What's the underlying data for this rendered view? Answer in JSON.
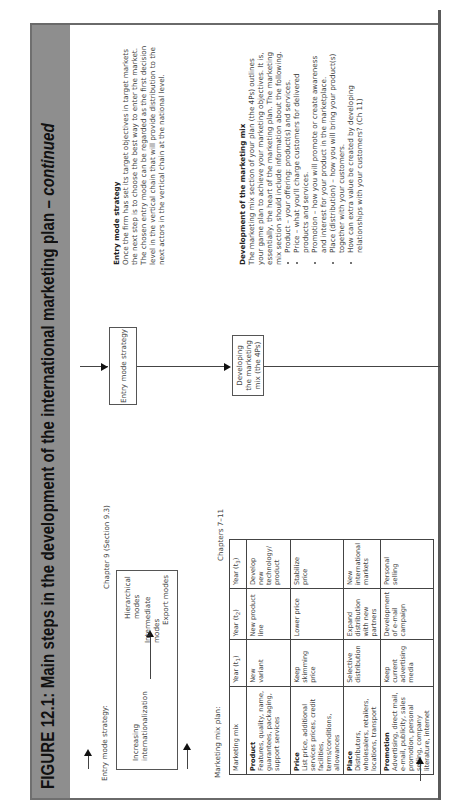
{
  "figure": {
    "title_main": "FIGURE 12.1: Main steps in the development of the international marketing plan – ",
    "title_continued": "continued",
    "header_color": "#8e8e8e"
  },
  "entry_mode_panel": {
    "label": "Entry mode strategy:",
    "axis_label": "Increasing internationalization",
    "modes": [
      "Hierarchical modes",
      "Intermediate modes",
      "Export modes"
    ]
  },
  "marketing_mix_panel": {
    "label": "Marketing mix plan:",
    "table": {
      "headers": [
        "Marketing mix",
        "Year (t1)",
        "Year (t2)",
        "Year (t3)"
      ],
      "rows": [
        {
          "title": "Product",
          "desc": "Features, quality, name, guarantees, packaging, support services",
          "t1": "New variant",
          "t2": "New product line",
          "t3": "Develop new technology/ product"
        },
        {
          "title": "Price",
          "desc": "List price, additional services prices, credit facilities, terms/conditions, allowances",
          "t1": "Keep skimming price",
          "t2": "Lower price",
          "t3": "Stabilize price"
        },
        {
          "title": "Place",
          "desc": "Distributors, wholesalers, retailers, locations, transport",
          "t1": "Selective distribution",
          "t2": "Expand distribution with new partners",
          "t3": "New international markets"
        },
        {
          "title": "Promotion",
          "desc": "Advertising, direct mail, e-mail, publicity, sales promotion, personal selling, company literature, internet",
          "t1": "Keep current advertising media",
          "t2": "Development of e-mail campaign",
          "t3": "Personal selling"
        }
      ]
    }
  },
  "chapter_refs": {
    "entry_mode": "Chapter 9 (Section 9.3)",
    "marketing_mix": "Chapters 7–11"
  },
  "flow_boxes": {
    "entry_mode": "Entry mode strategy",
    "marketing_mix": "Developing the marketing mix (the 4Ps)"
  },
  "descriptions": {
    "entry_mode": {
      "title": "Entry mode strategy",
      "text": "Once the firm has set its target objectives in target markets the next step is to choose the best way to enter the market. The chosen entry mode can be regarded as the first decision level in the vertical chain that will provide distribution to the next actors in the vertical chain at the national level."
    },
    "marketing_mix": {
      "title": "Development of the marketing mix",
      "text": "The marketing mix section of your plan (the 4Ps) outlines your game plan to achieve your marketing objectives. It is, essentially, the heart of the marketing plan. The marketing mix section should include information about the following.",
      "bullets": [
        "Product – your offering: product(s) and services.",
        "Price – what you'll charge customers for delivered products and services.",
        "Promotion – how you will promote or create awareness and interest for your product in the marketplace.",
        "Place (distribution) – how you will bring your product(s) together with your customers.",
        "How can extra value be created by developing relationships with your customers? (Ch 11)"
      ]
    }
  }
}
